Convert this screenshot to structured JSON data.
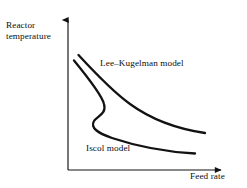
{
  "figure": {
    "background_color": "#ffffff",
    "ink_color": "#121212",
    "axes": {
      "y_axis_label": "Reactor\ntemperature",
      "x_axis_label": "Feed rate",
      "y_axis_label_lines": [
        "Reactor",
        "temperature"
      ],
      "origin": {
        "x": 68,
        "y": 170
      },
      "y_tip": {
        "x": 68,
        "y": 14
      },
      "x_tip": {
        "x": 227,
        "y": 170
      },
      "arrowheads": true,
      "ticks": [],
      "tick_labels": [],
      "grid": false
    },
    "curve_labels": {
      "upper": "Lee–Kugelman model",
      "lower": "Iscol model"
    }
  },
  "chart_data": {
    "type": "line",
    "title": "",
    "subtitle": "",
    "xlabel": "Feed rate",
    "ylabel": "Reactor temperature",
    "xlim": [
      0,
      1
    ],
    "ylim": [
      0,
      1
    ],
    "grid": false,
    "legend": "inline-annotations",
    "legend_position": "inline",
    "tick_labels": {
      "x": [],
      "y": []
    },
    "annotations": [
      {
        "text": "Lee–Kugelman model",
        "target": "upper-curve",
        "x": 0.22,
        "y": 0.73
      },
      {
        "text": "Iscol model",
        "target": "lower-curve",
        "x": 0.12,
        "y": 0.17
      }
    ],
    "series": [
      {
        "name": "Lee–Kugelman model",
        "monotonic": true,
        "path": "M 78.5 55 C 96 74, 112 91, 130 104 C 152 120, 178 129, 205 133",
        "points": [
          {
            "x": 0.066,
            "y": 0.737
          },
          {
            "x": 0.155,
            "y": 0.635
          },
          {
            "x": 0.251,
            "y": 0.547
          },
          {
            "x": 0.39,
            "y": 0.449
          },
          {
            "x": 0.55,
            "y": 0.378
          },
          {
            "x": 0.7,
            "y": 0.32
          },
          {
            "x": 0.861,
            "y": 0.237
          }
        ]
      },
      {
        "name": "Iscol model",
        "monotonic": false,
        "shape": "s-curve-hysteresis",
        "path": "M 74 60.5 C 90 80, 102 96, 104 104 C 107 114, 97 116, 94 121 C 90 128, 98 133, 112 138 C 136 146, 168 152, 195 153.5",
        "points": [
          {
            "x": 0.038,
            "y": 0.701
          },
          {
            "x": 0.12,
            "y": 0.6
          },
          {
            "x": 0.205,
            "y": 0.488
          },
          {
            "x": 0.228,
            "y": 0.43
          },
          {
            "x": 0.186,
            "y": 0.38
          },
          {
            "x": 0.165,
            "y": 0.345
          },
          {
            "x": 0.205,
            "y": 0.3
          },
          {
            "x": 0.3,
            "y": 0.25
          },
          {
            "x": 0.5,
            "y": 0.205
          },
          {
            "x": 0.7,
            "y": 0.185
          },
          {
            "x": 0.798,
            "y": 0.108
          }
        ]
      }
    ]
  }
}
